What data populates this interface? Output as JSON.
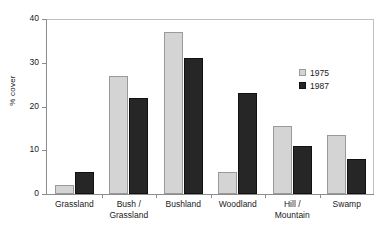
{
  "chart_data": {
    "type": "bar",
    "title": "",
    "subtitle": "",
    "xlabel": "",
    "ylabel": "% cover",
    "ylim": [
      0,
      40
    ],
    "yticks": [
      0,
      10,
      20,
      30,
      40
    ],
    "ytick_labels": [
      "0",
      "10",
      "20",
      "30",
      "40"
    ],
    "grid": false,
    "legend_position": "inside-top-right",
    "categories": [
      "Grassland",
      "Bush /\nGrassland",
      "Bushland",
      "Woodland",
      "Hill /\nMountain",
      "Swamp"
    ],
    "category_lines": [
      [
        "Grassland"
      ],
      [
        "Bush /",
        "Grassland"
      ],
      [
        "Bushland"
      ],
      [
        "Woodland"
      ],
      [
        "Hill /",
        "Mountain"
      ],
      [
        "Swamp"
      ]
    ],
    "series": [
      {
        "name": "1975",
        "color": "#d4d4d4",
        "values": [
          2,
          27,
          37,
          5,
          15.5,
          13.5
        ]
      },
      {
        "name": "1987",
        "color": "#262626",
        "values": [
          5,
          22,
          31,
          23,
          11,
          8
        ]
      }
    ]
  },
  "axis": {
    "y_title": "% cover"
  },
  "legend": {
    "items": [
      {
        "label": "1975",
        "color": "#d4d4d4"
      },
      {
        "label": "1987",
        "color": "#262626"
      }
    ]
  },
  "colors": {
    "series_1975": "#d4d4d4",
    "series_1987": "#262626",
    "axis": "#8c8c8c",
    "frame": "#bfbfbf",
    "background": "#ffffff",
    "text": "#1a1a1a"
  }
}
